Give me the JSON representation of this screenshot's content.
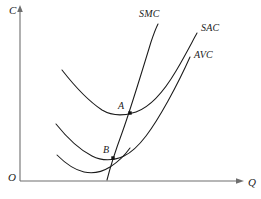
{
  "figure": {
    "type": "economics-cost-curve-diagram",
    "background_color": "#ffffff",
    "ink_color": "#1a1a1a",
    "axis_color": "#6e6e6e"
  },
  "axes": {
    "vertical": {
      "label": "C",
      "name": "cost-axis",
      "label_x": 10,
      "label_y": 14,
      "x": 20,
      "y_top": 8,
      "y_bottom": 181
    },
    "horizontal": {
      "label": "Q",
      "name": "quantity-axis",
      "label_x": 248,
      "label_y": 186,
      "y": 181,
      "x_left": 20,
      "x_right": 243
    },
    "origin": {
      "label": "O",
      "label_x": 9,
      "label_y": 180
    }
  },
  "curves": [
    {
      "id": "smc",
      "label": "SMC",
      "label_x": 139,
      "label_y": 17,
      "path": "M 107 180 C 110 168 115 152 122 133 C 130 111 140 78 151 42 C 154 33 156 28 158 24"
    },
    {
      "id": "sac",
      "label": "SAC",
      "label_x": 201,
      "label_y": 31,
      "path": "M 62 70 C 76 88 90 102 102 110 C 112 116 124 116 136 112 C 150 107 163 93 176 71 C 186 54 192 42 197 33"
    },
    {
      "id": "avc",
      "label": "AVC",
      "label_x": 194,
      "label_y": 58,
      "path": "M 56 124 C 68 139 80 150 92 156 C 102 161 113 161 124 156 C 139 149 153 128 168 101 C 179 81 186 66 190 57"
    },
    {
      "id": "avc-lower",
      "label": "",
      "label_x": 0,
      "label_y": 0,
      "path": "M 57 155 C 66 164 75 170 84 172 C 93 174 102 172 110 167 C 118 162 125 155 130 148"
    }
  ],
  "points": [
    {
      "id": "A",
      "label": "A",
      "x": 130,
      "y": 113,
      "label_x": 118,
      "label_y": 108,
      "size": 3.4
    },
    {
      "id": "B",
      "label": "B",
      "x": 113,
      "y": 158,
      "label_x": 103,
      "label_y": 152,
      "size": 3.4
    }
  ]
}
